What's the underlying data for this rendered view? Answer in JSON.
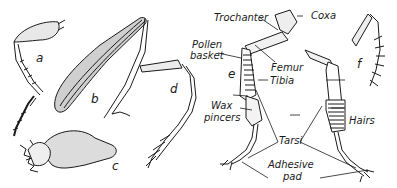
{
  "figure": {
    "panels": [
      {
        "id": "a",
        "label": "a"
      },
      {
        "id": "b",
        "label": "b"
      },
      {
        "id": "c",
        "label": "c"
      },
      {
        "id": "d",
        "label": "d"
      },
      {
        "id": "e",
        "label": "e"
      },
      {
        "id": "f",
        "label": "f"
      }
    ],
    "annotations": {
      "trochanter": "Trochanter",
      "coxa": "Coxa",
      "pollen_basket_1": "Pollen",
      "pollen_basket_2": "basket",
      "femur": "Femur",
      "tibia": "Tibia",
      "wax_pincers_1": "Wax",
      "wax_pincers_2": "pincers",
      "hairs": "Hairs",
      "tarsi": "Tarsi",
      "adhesive_pad_1": "Adhesive",
      "adhesive_pad_2": "pad"
    },
    "colors": {
      "ink": "#1a1a1a",
      "background": "#ffffff",
      "shade": "#6b6b6b"
    }
  }
}
